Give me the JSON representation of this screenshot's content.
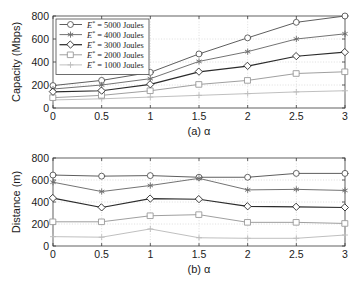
{
  "figure": {
    "background": "#ffffff",
    "width": 355,
    "height": 283
  },
  "legend": {
    "position": "upper-left",
    "entries": [
      {
        "label": "E* = 5000 Joules",
        "prefix": "E",
        "sup": "*",
        "rest": " = 5000 Joules",
        "marker": "circle-marker",
        "color": "#555555"
      },
      {
        "label": "E* = 4000 Joules",
        "prefix": "E",
        "sup": "*",
        "rest": " = 4000 Joules",
        "marker": "asterisk-marker",
        "color": "#6b6b6b"
      },
      {
        "label": "E* = 3000 Joules",
        "prefix": "E",
        "sup": "*",
        "rest": " = 3000 Joules",
        "marker": "diamond-marker",
        "color": "#2b2b2b"
      },
      {
        "label": "E* = 2000 Joules",
        "prefix": "E",
        "sup": "*",
        "rest": " = 2000 Joules",
        "marker": "square-marker",
        "color": "#9a9a9a"
      },
      {
        "label": "E* = 1000 Joules",
        "prefix": "E",
        "sup": "*",
        "rest": " = 1000 Joules",
        "marker": "plus-marker",
        "color": "#bcbcbc"
      }
    ]
  },
  "chart_data": [
    {
      "id": "capacity-chart",
      "type": "line",
      "title": "",
      "xlabel": "(a) α",
      "ylabel": "Capacity (Mbps)",
      "x": [
        0,
        0.5,
        1,
        1.5,
        2,
        2.5,
        3
      ],
      "xticklabels": [
        "0",
        "0.5",
        "1",
        "1.5",
        "2",
        "2.5",
        "3"
      ],
      "yticks": [
        0,
        200,
        400,
        600,
        800
      ],
      "yticklabels": [
        "0",
        "200",
        "400",
        "600",
        "800"
      ],
      "xlim": [
        0,
        3
      ],
      "ylim": [
        0,
        800
      ],
      "grid": true,
      "series": [
        {
          "name": "E* = 5000 Joules",
          "marker": "circle-marker",
          "color": "#555555",
          "values": [
            195,
            240,
            310,
            470,
            610,
            745,
            800
          ]
        },
        {
          "name": "E* = 4000 Joules",
          "marker": "asterisk-marker",
          "color": "#6b6b6b",
          "values": [
            165,
            200,
            255,
            405,
            490,
            600,
            645
          ]
        },
        {
          "name": "E* = 3000 Joules",
          "marker": "diamond-marker",
          "color": "#2b2b2b",
          "values": [
            140,
            150,
            205,
            315,
            365,
            450,
            485
          ]
        },
        {
          "name": "E* = 2000 Joules",
          "marker": "square-marker",
          "color": "#9a9a9a",
          "values": [
            90,
            110,
            150,
            205,
            240,
            300,
            315
          ]
        },
        {
          "name": "E* = 1000 Joules",
          "marker": "plus-marker",
          "color": "#bcbcbc",
          "values": [
            70,
            80,
            95,
            110,
            125,
            140,
            150
          ]
        }
      ]
    },
    {
      "id": "distance-chart",
      "type": "line",
      "title": "",
      "xlabel": "(b) α",
      "ylabel": "Distance (m)",
      "x": [
        0,
        0.5,
        1,
        1.5,
        2,
        2.5,
        3
      ],
      "xticklabels": [
        "0",
        "0.5",
        "1",
        "1.5",
        "2",
        "2.5",
        "3"
      ],
      "yticks": [
        0,
        200,
        400,
        600,
        800
      ],
      "yticklabels": [
        "0",
        "200",
        "400",
        "600",
        "800"
      ],
      "xlim": [
        0,
        3
      ],
      "ylim": [
        0,
        800
      ],
      "grid": true,
      "series": [
        {
          "name": "E* = 5000 Joules",
          "marker": "circle-marker",
          "color": "#555555",
          "values": [
            645,
            635,
            640,
            625,
            625,
            660,
            660
          ]
        },
        {
          "name": "E* = 4000 Joules",
          "marker": "asterisk-marker",
          "color": "#6b6b6b",
          "values": [
            580,
            495,
            550,
            615,
            510,
            515,
            505
          ]
        },
        {
          "name": "E* = 3000 Joules",
          "marker": "diamond-marker",
          "color": "#2b2b2b",
          "values": [
            435,
            350,
            430,
            425,
            360,
            355,
            350
          ]
        },
        {
          "name": "E* = 2000 Joules",
          "marker": "square-marker",
          "color": "#9a9a9a",
          "values": [
            220,
            220,
            275,
            285,
            215,
            215,
            205
          ]
        },
        {
          "name": "E* = 1000 Joules",
          "marker": "plus-marker",
          "color": "#bcbcbc",
          "values": [
            85,
            80,
            155,
            75,
            70,
            70,
            100
          ]
        }
      ]
    }
  ]
}
